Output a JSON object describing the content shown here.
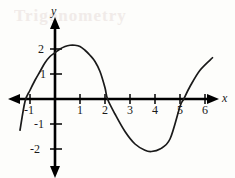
{
  "figure": {
    "background_color": "#fdfdfb",
    "curve_color": "#1a1a1a",
    "axis_color": "#000000",
    "watermark_text": "Trigonometry"
  },
  "axes": {
    "x_name": "x",
    "y_name": "y",
    "origin_px": [
      55,
      99
    ],
    "unit_px": 25,
    "x_range": [
      -1.6,
      6.8
    ],
    "y_range": [
      -2.7,
      2.6
    ],
    "x_tick_labels": [
      "-1",
      "1",
      "2",
      "3",
      "4",
      "5",
      "6"
    ],
    "x_tick_values": [
      -1,
      1,
      2,
      3,
      4,
      5,
      6
    ],
    "y_tick_labels": [
      "2",
      "1",
      "-1",
      "-2"
    ],
    "y_tick_values": [
      2,
      1,
      -1,
      -2
    ],
    "arrows": [
      "left",
      "right",
      "up",
      "down"
    ]
  },
  "chart_data": {
    "type": "line",
    "title": "",
    "xlabel": "x",
    "ylabel": "y",
    "xlim": [
      -1.6,
      6.8
    ],
    "ylim": [
      -2.7,
      2.6
    ],
    "grid": false,
    "legend": "none",
    "series": [
      {
        "name": "sinusoid",
        "description": "Sine-like curve, amplitude 2.15, period about 6.2, crossing upward near x = -1.15",
        "amplitude": 2.15,
        "period": 6.2,
        "phase_zero_crossing": -1.15,
        "peak": [
          0.8,
          2.15
        ],
        "trough": [
          3.85,
          -2.1
        ],
        "zero_crossings": [
          -1.15,
          2.1,
          5.15
        ],
        "x_start": -1.4,
        "x_end": 6.3,
        "y_at_x_start": -1.25,
        "y_at_x_end": 1.65,
        "points": [
          [
            -1.4,
            -1.25
          ],
          [
            -1.2,
            -0.1
          ],
          [
            -1.0,
            0.35
          ],
          [
            -0.8,
            0.75
          ],
          [
            -0.6,
            1.1
          ],
          [
            -0.4,
            1.45
          ],
          [
            -0.2,
            1.7
          ],
          [
            0.0,
            1.85
          ],
          [
            0.2,
            2.0
          ],
          [
            0.4,
            2.1
          ],
          [
            0.6,
            2.15
          ],
          [
            0.8,
            2.15
          ],
          [
            1.0,
            2.1
          ],
          [
            1.2,
            1.95
          ],
          [
            1.4,
            1.75
          ],
          [
            1.6,
            1.5
          ],
          [
            1.8,
            1.1
          ],
          [
            2.0,
            0.45
          ],
          [
            2.1,
            0.0
          ],
          [
            2.4,
            -0.6
          ],
          [
            2.8,
            -1.3
          ],
          [
            3.2,
            -1.8
          ],
          [
            3.6,
            -2.05
          ],
          [
            3.85,
            -2.1
          ],
          [
            4.2,
            -2.0
          ],
          [
            4.6,
            -1.6
          ],
          [
            5.0,
            -0.3
          ],
          [
            5.15,
            0.0
          ],
          [
            5.4,
            0.5
          ],
          [
            5.8,
            1.15
          ],
          [
            6.3,
            1.65
          ]
        ]
      }
    ]
  }
}
